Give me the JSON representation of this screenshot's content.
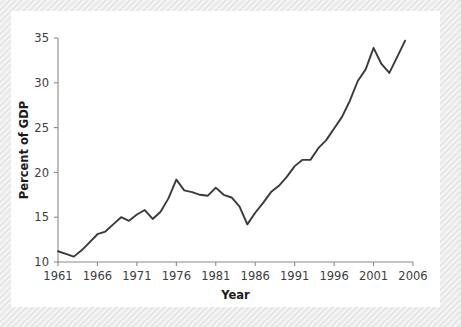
{
  "figure": {
    "background_color": "#e7e7e7",
    "panel_color": "#ffffff",
    "line_color": "#3a3a3a",
    "axis_color": "#8a8a8a",
    "text_color": "#3d3d3d"
  },
  "chart_data": {
    "type": "line",
    "title": "",
    "subtitle": "",
    "xlabel": "Year",
    "ylabel": "Percent of GDP",
    "xlim": [
      1961,
      2006
    ],
    "ylim": [
      10,
      35
    ],
    "grid": false,
    "legend": null,
    "xticks": [
      1961,
      1966,
      1971,
      1976,
      1981,
      1986,
      1991,
      1996,
      2001,
      2006
    ],
    "xtick_labels": [
      "1961",
      "1966",
      "1971",
      "1976",
      "1981",
      "1986",
      "1991",
      "1996",
      "2001",
      "2006"
    ],
    "yticks": [
      10,
      15,
      20,
      25,
      30,
      35
    ],
    "ytick_labels": [
      "10",
      "15",
      "20",
      "25",
      "30",
      "35"
    ],
    "series": [
      {
        "name": "Percent of GDP",
        "color": "#3a3a3a",
        "x": [
          1961,
          1962,
          1963,
          1964,
          1965,
          1966,
          1967,
          1968,
          1969,
          1970,
          1971,
          1972,
          1973,
          1974,
          1975,
          1976,
          1977,
          1978,
          1979,
          1980,
          1981,
          1982,
          1983,
          1984,
          1985,
          1986,
          1987,
          1988,
          1989,
          1990,
          1991,
          1992,
          1993,
          1994,
          1995,
          1996,
          1997,
          1998,
          1999,
          2000,
          2001,
          2002,
          2003,
          2004,
          2005
        ],
        "values": [
          11.2,
          10.9,
          10.6,
          11.3,
          12.2,
          13.1,
          13.4,
          14.2,
          15.0,
          14.6,
          15.3,
          15.8,
          14.8,
          15.6,
          17.1,
          19.2,
          18.0,
          17.8,
          17.5,
          17.4,
          18.3,
          17.5,
          17.2,
          16.2,
          14.2,
          15.5,
          16.6,
          17.8,
          18.5,
          19.5,
          20.7,
          21.4,
          21.4,
          22.7,
          23.6,
          24.9,
          26.2,
          28.0,
          30.2,
          31.5,
          33.9,
          32.1,
          31.1,
          32.9,
          34.7
        ]
      }
    ]
  }
}
